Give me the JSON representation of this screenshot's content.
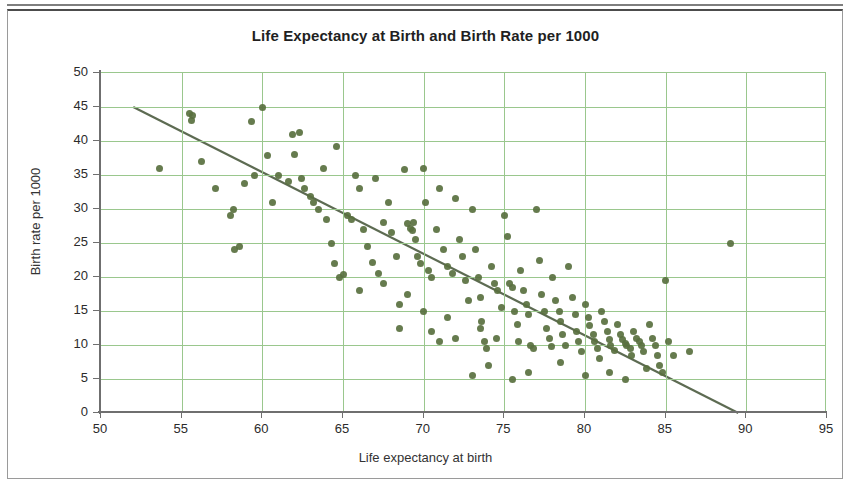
{
  "chart_data": {
    "type": "scatter",
    "title": "Life Expectancy at Birth and Birth Rate per 1000",
    "xlabel": "Life expectancy at birth",
    "ylabel": "Birth rate per 1000",
    "xlim": [
      50,
      95
    ],
    "ylim": [
      0,
      50
    ],
    "xticks": [
      50,
      55,
      60,
      65,
      70,
      75,
      80,
      85,
      90,
      95
    ],
    "yticks": [
      0,
      5,
      10,
      15,
      20,
      25,
      30,
      35,
      40,
      45,
      50
    ],
    "grid": true,
    "legend": "none",
    "marker_color": "#59703f",
    "grid_color": "#9ac78d",
    "trendline": {
      "type": "line",
      "color": "#5d6b52",
      "x": [
        52.0,
        89.5
      ],
      "y": [
        45.0,
        0.0
      ]
    },
    "series": [
      {
        "name": "Countries",
        "points": [
          [
            53.6,
            36.0
          ],
          [
            55.5,
            44.0
          ],
          [
            55.7,
            43.7
          ],
          [
            55.6,
            43.0
          ],
          [
            56.2,
            37.0
          ],
          [
            57.1,
            33.0
          ],
          [
            58.0,
            29.0
          ],
          [
            58.2,
            30.0
          ],
          [
            58.3,
            24.0
          ],
          [
            58.6,
            24.5
          ],
          [
            58.9,
            33.8
          ],
          [
            59.3,
            42.8
          ],
          [
            59.5,
            35.0
          ],
          [
            60.0,
            45.0
          ],
          [
            60.3,
            37.8
          ],
          [
            60.6,
            31.0
          ],
          [
            61.0,
            35.0
          ],
          [
            61.6,
            34.0
          ],
          [
            61.9,
            41.0
          ],
          [
            62.3,
            41.2
          ],
          [
            62.0,
            38.0
          ],
          [
            62.4,
            34.5
          ],
          [
            62.6,
            33.0
          ],
          [
            63.0,
            31.8
          ],
          [
            63.2,
            31.0
          ],
          [
            63.5,
            30.0
          ],
          [
            63.8,
            36.0
          ],
          [
            64.0,
            28.5
          ],
          [
            64.3,
            25.0
          ],
          [
            64.6,
            39.2
          ],
          [
            64.8,
            20.0
          ],
          [
            65.0,
            20.3
          ],
          [
            65.3,
            29.0
          ],
          [
            65.5,
            28.5
          ],
          [
            65.8,
            35.0
          ],
          [
            66.0,
            33.0
          ],
          [
            66.3,
            27.0
          ],
          [
            66.5,
            24.5
          ],
          [
            66.8,
            22.2
          ],
          [
            67.0,
            34.5
          ],
          [
            67.2,
            20.5
          ],
          [
            67.5,
            28.0
          ],
          [
            67.8,
            31.0
          ],
          [
            68.0,
            26.5
          ],
          [
            68.3,
            23.0
          ],
          [
            68.5,
            16.0
          ],
          [
            68.8,
            35.8
          ],
          [
            69.0,
            27.8
          ],
          [
            69.2,
            27.2
          ],
          [
            69.3,
            26.8
          ],
          [
            69.4,
            28.0
          ],
          [
            69.5,
            25.5
          ],
          [
            69.6,
            23.0
          ],
          [
            69.8,
            22.0
          ],
          [
            70.0,
            36.0
          ],
          [
            70.1,
            31.0
          ],
          [
            70.3,
            21.0
          ],
          [
            70.5,
            20.0
          ],
          [
            70.8,
            27.0
          ],
          [
            71.0,
            33.0
          ],
          [
            71.2,
            24.0
          ],
          [
            71.5,
            21.5
          ],
          [
            71.8,
            20.5
          ],
          [
            72.0,
            31.5
          ],
          [
            72.2,
            25.5
          ],
          [
            72.4,
            23.0
          ],
          [
            72.6,
            19.5
          ],
          [
            72.8,
            16.5
          ],
          [
            73.0,
            30.0
          ],
          [
            73.2,
            24.0
          ],
          [
            73.4,
            20.0
          ],
          [
            73.5,
            17.0
          ],
          [
            73.6,
            13.5
          ],
          [
            73.8,
            10.5
          ],
          [
            73.9,
            9.5
          ],
          [
            74.0,
            7.0
          ],
          [
            74.2,
            21.5
          ],
          [
            74.4,
            19.0
          ],
          [
            74.6,
            18.0
          ],
          [
            74.8,
            15.5
          ],
          [
            75.0,
            29.0
          ],
          [
            75.2,
            26.0
          ],
          [
            75.3,
            19.0
          ],
          [
            75.5,
            18.5
          ],
          [
            75.6,
            15.0
          ],
          [
            75.8,
            13.0
          ],
          [
            75.9,
            10.5
          ],
          [
            76.0,
            21.0
          ],
          [
            76.2,
            18.0
          ],
          [
            76.4,
            16.0
          ],
          [
            76.5,
            14.5
          ],
          [
            76.6,
            10.0
          ],
          [
            76.8,
            9.5
          ],
          [
            77.0,
            30.0
          ],
          [
            77.2,
            22.5
          ],
          [
            77.3,
            17.5
          ],
          [
            77.5,
            15.0
          ],
          [
            77.6,
            12.5
          ],
          [
            77.8,
            11.0
          ],
          [
            77.9,
            9.8
          ],
          [
            78.0,
            20.0
          ],
          [
            78.2,
            16.5
          ],
          [
            78.4,
            15.0
          ],
          [
            78.5,
            13.5
          ],
          [
            78.6,
            11.5
          ],
          [
            78.8,
            10.0
          ],
          [
            79.0,
            21.5
          ],
          [
            79.2,
            17.0
          ],
          [
            79.4,
            14.5
          ],
          [
            79.5,
            12.0
          ],
          [
            79.6,
            10.5
          ],
          [
            79.8,
            9.0
          ],
          [
            80.0,
            16.0
          ],
          [
            80.2,
            14.0
          ],
          [
            80.3,
            12.8
          ],
          [
            80.5,
            11.5
          ],
          [
            80.6,
            10.5
          ],
          [
            80.8,
            9.5
          ],
          [
            80.9,
            8.0
          ],
          [
            81.0,
            15.0
          ],
          [
            81.2,
            13.5
          ],
          [
            81.4,
            12.0
          ],
          [
            81.5,
            10.8
          ],
          [
            81.6,
            10.0
          ],
          [
            81.8,
            9.2
          ],
          [
            82.0,
            13.0
          ],
          [
            82.2,
            11.5
          ],
          [
            82.3,
            10.8
          ],
          [
            82.5,
            10.2
          ],
          [
            82.6,
            10.0
          ],
          [
            82.8,
            9.5
          ],
          [
            82.9,
            8.5
          ],
          [
            83.0,
            12.0
          ],
          [
            83.2,
            11.0
          ],
          [
            83.4,
            10.5
          ],
          [
            83.5,
            10.0
          ],
          [
            83.6,
            9.0
          ],
          [
            83.8,
            6.5
          ],
          [
            84.0,
            13.0
          ],
          [
            84.2,
            11.0
          ],
          [
            84.4,
            10.0
          ],
          [
            84.5,
            8.5
          ],
          [
            84.6,
            7.0
          ],
          [
            84.8,
            6.0
          ],
          [
            85.0,
            19.5
          ],
          [
            85.2,
            10.5
          ],
          [
            85.5,
            8.5
          ],
          [
            86.5,
            9.0
          ],
          [
            89.0,
            25.0
          ],
          [
            73.0,
            5.5
          ],
          [
            75.5,
            5.0
          ],
          [
            76.5,
            6.0
          ],
          [
            78.5,
            7.5
          ],
          [
            80.0,
            5.5
          ],
          [
            81.5,
            6.0
          ],
          [
            82.5,
            5.0
          ],
          [
            70.5,
            12.0
          ],
          [
            71.0,
            10.5
          ],
          [
            72.0,
            11.0
          ],
          [
            69.0,
            17.5
          ],
          [
            67.5,
            19.0
          ],
          [
            66.0,
            18.0
          ],
          [
            64.5,
            22.0
          ],
          [
            70.0,
            15.0
          ],
          [
            71.5,
            14.0
          ],
          [
            68.5,
            12.5
          ],
          [
            74.5,
            11.0
          ],
          [
            73.5,
            12.5
          ]
        ]
      }
    ]
  },
  "axis": {
    "y_tick_labels": [
      "50",
      "45",
      "40",
      "35",
      "30",
      "25",
      "20",
      "15",
      "10",
      "5",
      "0"
    ],
    "x_tick_labels": [
      "50",
      "55",
      "60",
      "65",
      "70",
      "75",
      "80",
      "85",
      "90",
      "95"
    ]
  }
}
